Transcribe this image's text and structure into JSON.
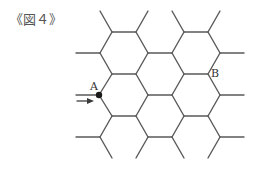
{
  "figure": {
    "caption": "《図４》",
    "point_a_label": "A",
    "point_b_label": "B",
    "edge_color": "#5a5a5a",
    "point_color": "#1a1a1a"
  },
  "lattice": {
    "description": "Honeycomb (hexagonal) grid of edges with loose end stubs",
    "edges": [
      [
        100,
        11,
        112,
        32
      ],
      [
        112,
        32,
        136,
        32
      ],
      [
        136,
        32,
        148,
        11
      ],
      [
        136,
        32,
        148,
        53
      ],
      [
        148,
        53,
        172,
        53
      ],
      [
        172,
        53,
        184,
        32
      ],
      [
        184,
        32,
        208,
        32
      ],
      [
        208,
        32,
        220,
        11
      ],
      [
        184,
        32,
        172,
        11
      ],
      [
        208,
        32,
        220,
        53
      ],
      [
        220,
        53,
        244,
        53
      ],
      [
        100,
        53,
        76,
        53
      ],
      [
        100,
        53,
        112,
        32
      ],
      [
        100,
        53,
        112,
        74
      ],
      [
        112,
        74,
        136,
        74
      ],
      [
        136,
        74,
        148,
        53
      ],
      [
        136,
        74,
        148,
        95
      ],
      [
        148,
        95,
        172,
        95
      ],
      [
        172,
        95,
        184,
        74
      ],
      [
        184,
        74,
        172,
        53
      ],
      [
        184,
        74,
        208,
        74
      ],
      [
        208,
        74,
        220,
        53
      ],
      [
        208,
        74,
        220,
        95
      ],
      [
        220,
        95,
        244,
        95
      ],
      [
        99,
        95,
        112,
        74
      ],
      [
        99,
        95,
        112,
        116
      ],
      [
        112,
        116,
        136,
        116
      ],
      [
        136,
        116,
        148,
        95
      ],
      [
        136,
        116,
        148,
        137
      ],
      [
        148,
        137,
        172,
        137
      ],
      [
        172,
        137,
        184,
        116
      ],
      [
        184,
        116,
        172,
        95
      ],
      [
        184,
        116,
        208,
        116
      ],
      [
        208,
        116,
        220,
        95
      ],
      [
        208,
        116,
        220,
        137
      ],
      [
        220,
        137,
        244,
        137
      ],
      [
        100,
        137,
        76,
        137
      ],
      [
        100,
        137,
        112,
        116
      ],
      [
        100,
        137,
        112,
        158
      ],
      [
        148,
        137,
        136,
        158
      ],
      [
        172,
        137,
        184,
        158
      ],
      [
        220,
        137,
        208,
        158
      ]
    ],
    "point_a": [
      99,
      95
    ],
    "point_b": [
      208,
      74
    ],
    "arrow": {
      "x1": 77,
      "y1": 101,
      "x2": 94,
      "y2": 101
    },
    "stub_a": {
      "x1": 76,
      "y1": 95,
      "x2": 99,
      "y2": 95
    }
  }
}
